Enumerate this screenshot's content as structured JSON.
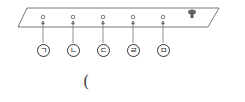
{
  "diagram": {
    "plate": {
      "points": "27,8 219,8 208,27 18,27",
      "stroke": "#555555"
    },
    "holes": [
      {
        "id": "hole-1",
        "cx": 43,
        "cy": 17,
        "label": "ㄱ",
        "label_x": 37,
        "label_y": 44
      },
      {
        "id": "hole-2",
        "cx": 73,
        "cy": 17,
        "label": "ㄴ",
        "label_x": 67,
        "label_y": 44
      },
      {
        "id": "hole-3",
        "cx": 103,
        "cy": 17,
        "label": "ㄷ",
        "label_x": 97,
        "label_y": 44
      },
      {
        "id": "hole-4",
        "cx": 133,
        "cy": 17,
        "label": "ㄹ",
        "label_x": 127,
        "label_y": 44
      },
      {
        "id": "hole-5",
        "cx": 163,
        "cy": 17,
        "label": "ㅁ",
        "label_x": 157,
        "label_y": 44
      }
    ],
    "peg": {
      "x": 192,
      "y": 13
    },
    "answer_paren": "("
  }
}
